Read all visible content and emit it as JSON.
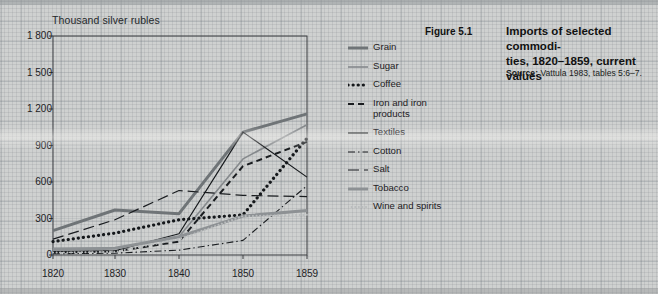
{
  "figure": {
    "number": "Figure 5.1",
    "source_label": "Source:",
    "source_text": " Vattula 1983, tables 5:6–7."
  },
  "chart_data": {
    "type": "line",
    "xlabel": "",
    "ylabel": "Thousand silver rubles",
    "x": [
      1820,
      1830,
      1840,
      1850,
      1859
    ],
    "xtick_labels": [
      "1820",
      "1830",
      "1840",
      "1850",
      "1859"
    ],
    "ytick_labels": [
      "0",
      "300",
      "600",
      "900",
      "1 200",
      "1 500",
      "1 800"
    ],
    "yticks": [
      0,
      300,
      600,
      900,
      1200,
      1500,
      1800
    ],
    "ylim": [
      0,
      1800
    ],
    "grid": true,
    "legend_position": "right",
    "series": [
      {
        "name": "Grain",
        "values": [
          200,
          370,
          340,
          1010,
          1160
        ],
        "style": "solid",
        "width": 3.0,
        "color": "#6f7477",
        "dash": ""
      },
      {
        "name": "Sugar",
        "values": [
          55,
          55,
          150,
          790,
          1070
        ],
        "style": "solid",
        "width": 1.6,
        "color": "#85898c",
        "dash": ""
      },
      {
        "name": "Coffee",
        "values": [
          110,
          180,
          290,
          330,
          960
        ],
        "style": "dotted",
        "width": 3.2,
        "color": "#15181b",
        "dash": "0.1 5"
      },
      {
        "name": "Iron and iron\nproducts",
        "values": [
          20,
          30,
          110,
          730,
          930
        ],
        "style": "dashed",
        "width": 2.0,
        "color": "#1a1d20",
        "dash": "6 4"
      },
      {
        "name": "Textiles",
        "values": [
          30,
          35,
          175,
          1010,
          640
        ],
        "style": "solid",
        "width": 1.2,
        "color": "#16191c",
        "dash": ""
      },
      {
        "name": "Cotton",
        "values": [
          10,
          15,
          40,
          120,
          570
        ],
        "style": "dashdot",
        "width": 1.1,
        "color": "#1a1d20",
        "dash": "7 3 1.5 3"
      },
      {
        "name": "Salt",
        "values": [
          130,
          290,
          530,
          490,
          480
        ],
        "style": "longdash",
        "width": 1.2,
        "color": "#1a1d20",
        "dash": "11 5"
      },
      {
        "name": "Tobacco",
        "values": [
          45,
          55,
          150,
          320,
          365
        ],
        "style": "solid",
        "width": 3.0,
        "color": "#8d9194",
        "dash": ""
      },
      {
        "name": "Wine and\nspirits",
        "values": [
          20,
          25,
          130,
          320,
          330
        ],
        "style": "finedot",
        "width": 2.0,
        "color": "#b9bcbd",
        "dash": "0.1 3.5"
      }
    ]
  },
  "legend": {
    "items": [
      {
        "label": "Grain"
      },
      {
        "label": "Sugar"
      },
      {
        "label": "Coffee"
      },
      {
        "label": "Iron and iron products"
      },
      {
        "label": "Textiles"
      },
      {
        "label": "Cotton"
      },
      {
        "label": "Salt"
      },
      {
        "label": "Tobacco"
      },
      {
        "label": "Wine and spirits"
      }
    ]
  }
}
